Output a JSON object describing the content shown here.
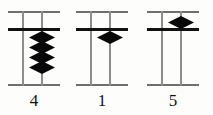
{
  "figure": {
    "type": "abacus-soroban-diagram",
    "background_color": "#fdfdfc",
    "bead_color": "#080808",
    "crossbar_color": "#111111",
    "rod_color": "#8d8d8d",
    "frame_color": "#6f6f6f",
    "columns": [
      {
        "label": "4",
        "value": 4,
        "heaven_beads": 0,
        "earth_beads": 4,
        "left_px": 8,
        "width_px": 52,
        "rod_left_px": 14,
        "rod_right_px": 33,
        "bead_center_px": 34
      },
      {
        "label": "1",
        "value": 1,
        "heaven_beads": 0,
        "earth_beads": 1,
        "left_px": 76,
        "width_px": 52,
        "rod_left_px": 14,
        "rod_right_px": 33,
        "bead_center_px": 34
      },
      {
        "label": "5",
        "value": 5,
        "heaven_beads": 1,
        "earth_beads": 0,
        "left_px": 147,
        "width_px": 52,
        "rod_left_px": 14,
        "rod_right_px": 33,
        "bead_center_px": 34
      }
    ],
    "geometry": {
      "top_bar_y": 11,
      "cross_bar_y": 28,
      "bottom_bar_y": 84,
      "rod_top_y": 11,
      "rod_bottom_y": 86,
      "earth_bead_start_y": 31,
      "heaven_bead_y": 16,
      "bead_step_y": 10,
      "label_y": 92
    }
  }
}
